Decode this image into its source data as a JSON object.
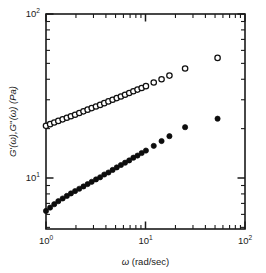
{
  "figure": {
    "background_color": "#ffffff",
    "foreground_color": "#1a1a1a"
  },
  "axes": {
    "x": {
      "label_prefix": "",
      "label": "ω (rad/sec)",
      "scale": "log",
      "min": 1,
      "max": 100,
      "tick_labels": [
        "10",
        "10",
        "10"
      ],
      "tick_exponents": [
        "0",
        "1",
        "2"
      ],
      "tick_values": [
        1,
        10,
        100
      ]
    },
    "y": {
      "label": "G'(ω),G''(ω) (Pa)",
      "label_parts": {
        "g1": "G",
        "prime1": "'",
        "omega1": "(ω),",
        "g2": "G",
        "prime2": "''",
        "omega2": "(ω) (Pa)"
      },
      "scale": "log",
      "min": 3.7,
      "max": 100,
      "tick_labels": [
        "10",
        "10"
      ],
      "tick_exponents": [
        "1",
        "2"
      ],
      "tick_values": [
        10,
        100
      ]
    }
  },
  "chart_data": {
    "type": "scatter",
    "title": "",
    "xlabel": "ω (rad/sec)",
    "ylabel": "G'(ω),G''(ω) (Pa)",
    "xscale": "log",
    "yscale": "log",
    "xlim": [
      1,
      100
    ],
    "ylim": [
      3.7,
      100
    ],
    "grid": false,
    "legend": "none",
    "series": [
      {
        "name": "G''(ω)",
        "marker": "open-circle",
        "marker_face_color": "#ffffff",
        "marker_edge_color": "#111111",
        "marker_size_px": 5.4,
        "x": [
          1.0,
          1.1,
          1.21,
          1.33,
          1.47,
          1.62,
          1.78,
          1.96,
          2.16,
          2.38,
          2.62,
          2.88,
          3.18,
          3.5,
          3.85,
          4.24,
          4.67,
          5.14,
          5.66,
          6.23,
          6.86,
          7.55,
          8.31,
          9.15,
          10.1,
          12.1,
          14.5,
          17.4,
          25.0,
          53.0
        ],
        "y": [
          20.8,
          21.3,
          21.8,
          22.3,
          22.8,
          23.3,
          23.8,
          24.3,
          24.9,
          25.5,
          26.1,
          26.7,
          27.3,
          27.9,
          28.6,
          29.3,
          30.0,
          30.7,
          31.4,
          32.2,
          33.0,
          33.8,
          34.6,
          35.4,
          36.3,
          38.2,
          40.0,
          42.1,
          46.5,
          54.0
        ]
      },
      {
        "name": "G'(ω)",
        "marker": "filled-circle",
        "marker_face_color": "#0d0d0d",
        "marker_edge_color": "#0d0d0d",
        "marker_size_px": 5.2,
        "x": [
          1.0,
          1.1,
          1.21,
          1.33,
          1.47,
          1.62,
          1.78,
          1.96,
          2.16,
          2.38,
          2.62,
          2.88,
          3.18,
          3.5,
          3.85,
          4.24,
          4.67,
          5.14,
          5.66,
          6.23,
          6.86,
          7.55,
          8.31,
          9.15,
          10.1,
          12.1,
          14.5,
          17.4,
          25.0,
          53.0
        ],
        "y": [
          6.3,
          6.6,
          6.92,
          7.22,
          7.5,
          7.78,
          8.05,
          8.32,
          8.6,
          8.88,
          9.18,
          9.48,
          9.8,
          10.1,
          10.5,
          10.8,
          11.2,
          11.6,
          12.0,
          12.4,
          12.8,
          13.3,
          13.7,
          14.2,
          14.7,
          15.7,
          16.8,
          18.0,
          20.4,
          23.0
        ]
      }
    ]
  }
}
